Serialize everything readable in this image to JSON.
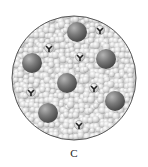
{
  "figure": {
    "label": "C",
    "colors": {
      "background_particles": "#d4d4d4",
      "large_spheres": "#6e6e6e",
      "outline": "#555555",
      "molecule": "#222222"
    },
    "circle": {
      "cx": 74,
      "cy": 78,
      "r": 62
    },
    "large_spheres": [
      {
        "cx": 77,
        "cy": 32,
        "r": 10
      },
      {
        "cx": 32,
        "cy": 63,
        "r": 10
      },
      {
        "cx": 106,
        "cy": 59,
        "r": 10
      },
      {
        "cx": 67,
        "cy": 83,
        "r": 10
      },
      {
        "cx": 48,
        "cy": 113,
        "r": 10
      },
      {
        "cx": 115,
        "cy": 101,
        "r": 10
      }
    ],
    "molecules": [
      {
        "cx": 100,
        "cy": 30
      },
      {
        "cx": 49,
        "cy": 48
      },
      {
        "cx": 80,
        "cy": 57
      },
      {
        "cx": 31,
        "cy": 92
      },
      {
        "cx": 94,
        "cy": 88
      },
      {
        "cx": 79,
        "cy": 125
      }
    ]
  }
}
